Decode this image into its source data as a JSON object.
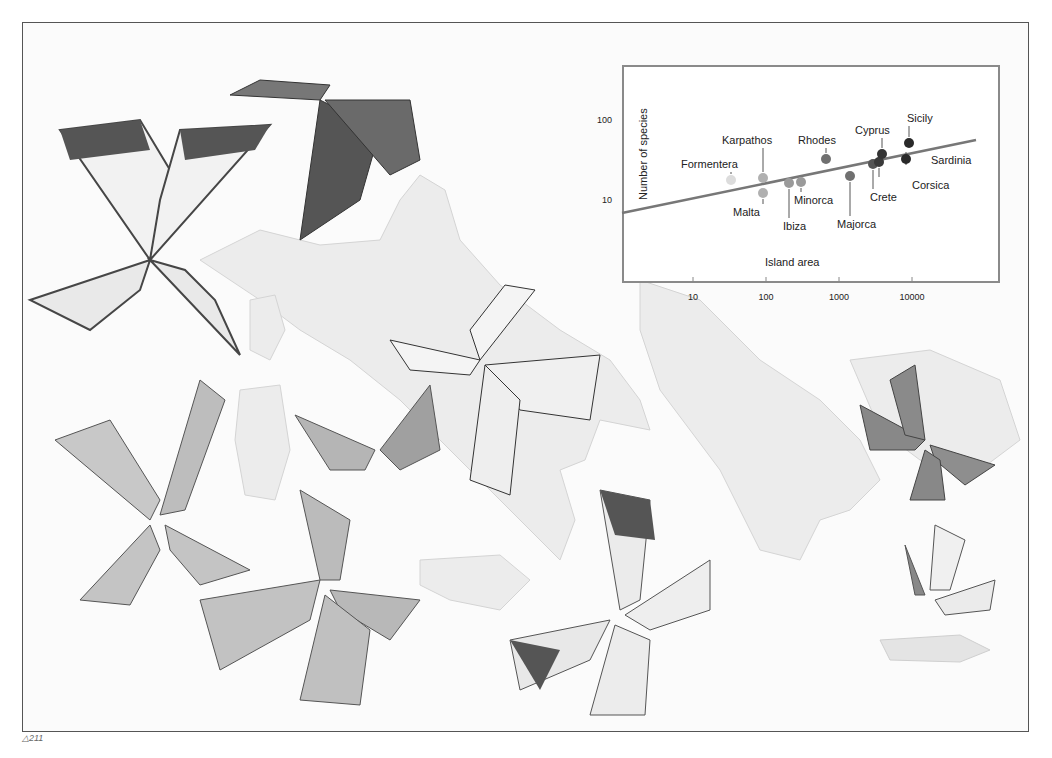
{
  "figure_label": "△211",
  "chart_data": {
    "type": "scatter",
    "title": "",
    "xlabel": "Island area",
    "ylabel": "Number of species",
    "xscale": "log",
    "yscale": "log",
    "x_ticks": [
      "10",
      "100",
      "1000",
      "10000"
    ],
    "y_ticks": [
      "10",
      "100"
    ],
    "grid": false,
    "points": [
      {
        "label": "Formentera",
        "x": 30,
        "y": 16,
        "color": "#dcdcdc"
      },
      {
        "label": "Karpathos",
        "x": 85,
        "y": 17,
        "color": "#b0b0b0"
      },
      {
        "label": "Malta",
        "x": 85,
        "y": 11.5,
        "color": "#b0b0b0"
      },
      {
        "label": "Ibiza",
        "x": 195,
        "y": 15,
        "color": "#9a9a9a"
      },
      {
        "label": "Minorca",
        "x": 290,
        "y": 15.5,
        "color": "#9a9a9a"
      },
      {
        "label": "Rhodes",
        "x": 620,
        "y": 28,
        "color": "#707070"
      },
      {
        "label": "Majorca",
        "x": 1300,
        "y": 18,
        "color": "#707070"
      },
      {
        "label": "Crete",
        "x": 2700,
        "y": 24,
        "color": "#555555"
      },
      {
        "label": "Corsica",
        "x": 3300,
        "y": 26,
        "color": "#3a3a3a"
      },
      {
        "label": "Cyprus",
        "x": 3600,
        "y": 33,
        "color": "#333333"
      },
      {
        "label": "Sardinia",
        "x": 8500,
        "y": 28,
        "color": "#2a2a2a"
      },
      {
        "label": "Sicily",
        "x": 9200,
        "y": 45,
        "color": "#2a2a2a"
      }
    ],
    "trend_line": {
      "x": [
        1,
        70000
      ],
      "y": [
        6.8,
        55
      ]
    }
  },
  "chart_svg": {
    "points": [
      {
        "cx": 141,
        "cy": 120,
        "tx": 91,
        "ty": 108,
        "lx1": 141,
        "ly1": 108,
        "lx2": 141,
        "ly2": 114,
        "anchor": "start",
        "ltx": 89
      },
      {
        "cx": 173,
        "cy": 118,
        "tx": 132,
        "ty": 84
      },
      {
        "cx": 173,
        "cy": 133,
        "tx": 143,
        "ty": 156
      },
      {
        "cx": 199,
        "cy": 123,
        "tx": 193,
        "ty": 170
      },
      {
        "cx": 211,
        "cy": 122,
        "tx": 204,
        "ty": 144
      },
      {
        "cx": 236,
        "cy": 99,
        "tx": 208,
        "ty": 84
      },
      {
        "cx": 260,
        "cy": 116,
        "tx": 247,
        "ty": 168
      },
      {
        "cx": 283,
        "cy": 104,
        "tx": 280,
        "ty": 141
      },
      {
        "cx": 289,
        "cy": 102,
        "tx": 322,
        "ty": 129
      },
      {
        "cx": 292,
        "cy": 94,
        "tx": 265,
        "ty": 74
      },
      {
        "cx": 316,
        "cy": 99,
        "tx": 341,
        "ty": 104
      },
      {
        "cx": 319,
        "cy": 83,
        "tx": 317,
        "ty": 62
      }
    ]
  }
}
